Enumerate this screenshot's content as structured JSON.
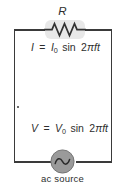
{
  "figure": {
    "type": "ac-circuit-diagram",
    "width": 125,
    "height": 190,
    "background_color": "#ffffff",
    "wire_color": "#3a3a3a",
    "text_color": "#2e2e2e",
    "highlight_color": "#e8e8e8",
    "source_fill_color": "#9a9a9a"
  },
  "labels": {
    "resistor": "R",
    "ac_source": "ac source"
  },
  "equations": {
    "current": {
      "full_text": "I = I0 sin 2πft",
      "lhs": "I",
      "equals": "=",
      "amplitude_symbol": "I",
      "amplitude_subscript": "0",
      "function": "sin",
      "coefficient": "2",
      "pi": "π",
      "frequency_time": "ft"
    },
    "voltage": {
      "full_text": "V = V0 sin 2πft",
      "lhs": "V",
      "equals": "=",
      "amplitude_symbol": "V",
      "amplitude_subscript": "0",
      "function": "sin",
      "coefficient": "2",
      "pi": "π",
      "frequency_time": "ft"
    }
  },
  "components": [
    {
      "name": "resistor",
      "symbol": "zigzag",
      "label": "R",
      "position": "top-branch",
      "highlighted": true
    },
    {
      "name": "ac-source",
      "symbol": "sine-wave-in-circle",
      "label": "ac source",
      "position": "bottom-branch",
      "highlighted": false
    }
  ]
}
